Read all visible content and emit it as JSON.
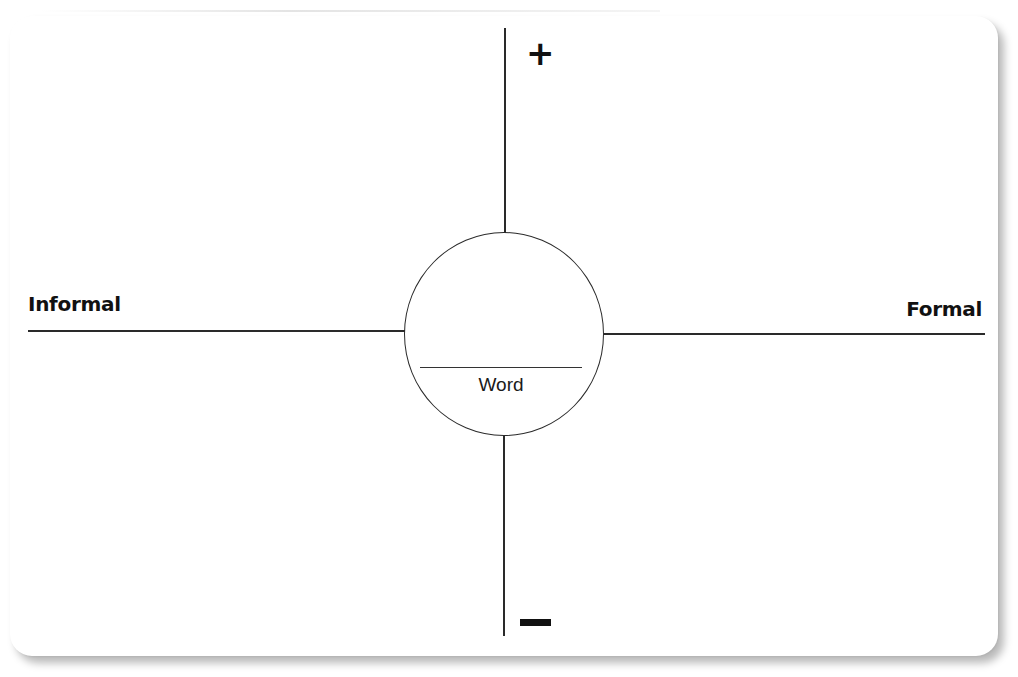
{
  "diagram": {
    "type": "word-map-quadrant",
    "center": {
      "label": "Word"
    },
    "axes": {
      "horizontal": {
        "left_label": "Informal",
        "right_label": "Formal"
      },
      "vertical": {
        "top_label": "+",
        "bottom_label": "−"
      }
    },
    "colors": {
      "background": "#ffffff",
      "line": "#2a2a2a",
      "text": "#111111",
      "shadow": "#9a9a9a"
    }
  }
}
